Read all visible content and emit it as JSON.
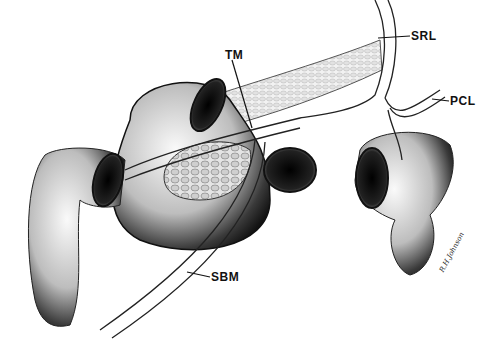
{
  "figure": {
    "labels": [
      {
        "id": "tm",
        "text": "TM",
        "x": 225,
        "y": 52
      },
      {
        "id": "srl",
        "text": "SRL",
        "x": 411,
        "y": 31
      },
      {
        "id": "pcl",
        "text": "PCL",
        "x": 450,
        "y": 95
      },
      {
        "id": "sbm",
        "text": "SBM",
        "x": 210,
        "y": 271
      }
    ],
    "signature": "R.H.Johnson"
  }
}
